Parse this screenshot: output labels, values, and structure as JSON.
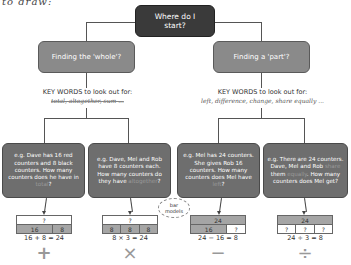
{
  "header_text": "to draw:",
  "root": {
    "label": "Where do I start?"
  },
  "branches": [
    {
      "label": "Finding the 'whole'?",
      "keywords_title": "KEY WORDS to look out for:",
      "keywords": "total, altogether, sum ...",
      "examples": [
        {
          "pre": "e.g. Dave has 16 red counters and 8 black counters. How many counters does he have in ",
          "hl": "total",
          "post": "?",
          "bar": {
            "top": [
              "?"
            ],
            "bottom": [
              "16",
              "8"
            ],
            "shaded": "bottom"
          },
          "equation": "16 + 8 = 24",
          "operator": "+"
        },
        {
          "pre": "e.g. Dave, Mel and Rob have 8 counters each. How many counters do they have ",
          "hl": "altogether",
          "post": "?",
          "bar": {
            "top": [
              "?"
            ],
            "bottom": [
              "8",
              "8",
              "8"
            ],
            "shaded": "bottom"
          },
          "equation": "8 × 3 = 24",
          "operator": "×"
        }
      ]
    },
    {
      "label": "Finding a 'part'?",
      "keywords_title": "KEY WORDS to look out for:",
      "keywords": "left, difference, change, share equally ...",
      "examples": [
        {
          "pre": "e.g. Mel has 24 counters. She gives Rob 16 counters. How many counters does Mel have ",
          "hl": "left",
          "post": "?",
          "bar": {
            "top": [
              "24"
            ],
            "bottom": [
              "16",
              "?"
            ],
            "shaded": "top"
          },
          "equation": "24 − 16 = 8",
          "operator": "−"
        },
        {
          "pre": "e.g. There are 24 counters. Dave, Mel and Rob ",
          "hl": "share",
          "mid": " them ",
          "hl2": "equally",
          "post": ". How many counters does Mel get?",
          "bar": {
            "top": [
              "24"
            ],
            "bottom": [
              "?",
              "?",
              "?"
            ],
            "shaded": "top"
          },
          "equation": "24 ÷ 3 = 8",
          "operator": "÷"
        }
      ]
    }
  ],
  "cloud_label": "bar models",
  "colors": {
    "root": "#3a3a3a",
    "branch": "#8a8a8a",
    "example": "#6e6e6e",
    "bar_shaded": "#a5a5a5"
  }
}
